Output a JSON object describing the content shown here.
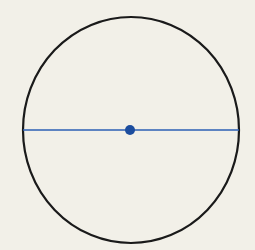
{
  "diagram": {
    "title": "",
    "elements": [
      {
        "kind": "circle",
        "role": "circle-outline"
      },
      {
        "kind": "segment",
        "role": "diameter",
        "passes_through_center": true,
        "orientation": "horizontal"
      },
      {
        "kind": "point",
        "role": "center-point"
      }
    ],
    "labels": []
  },
  "colors": {
    "background": "#f2f0e8",
    "circle_stroke": "#1a1a1a",
    "diameter": "#2b5fb4",
    "center_point": "#1c4d9e"
  }
}
